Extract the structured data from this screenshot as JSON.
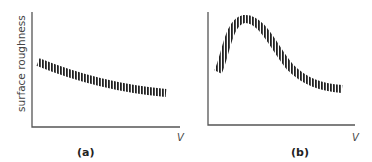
{
  "figure": {
    "y_axis_label": "surface roughness",
    "panels": [
      {
        "id": "a",
        "label": "(a)",
        "x_axis_label": "V",
        "curve": "monotonically decreasing, leveling off"
      },
      {
        "id": "b",
        "label": "(b)",
        "x_axis_label": "V",
        "curve": "rises steeply to a peak, then decreases and levels off"
      }
    ],
    "colors": {
      "axis": "#555555",
      "curve": "#222222",
      "text": "#444444"
    }
  }
}
